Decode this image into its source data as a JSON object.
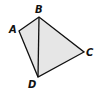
{
  "diagram": {
    "type": "quadrilateral",
    "vertices": [
      {
        "id": "A",
        "label": "A"
      },
      {
        "id": "B",
        "label": "B"
      },
      {
        "id": "C",
        "label": "C"
      },
      {
        "id": "D",
        "label": "D"
      }
    ],
    "edges": [
      [
        "A",
        "B"
      ],
      [
        "B",
        "C"
      ],
      [
        "C",
        "D"
      ],
      [
        "D",
        "A"
      ],
      [
        "B",
        "D"
      ]
    ],
    "colors": {
      "fill": "#e6e6e6",
      "stroke": "#111111"
    }
  }
}
